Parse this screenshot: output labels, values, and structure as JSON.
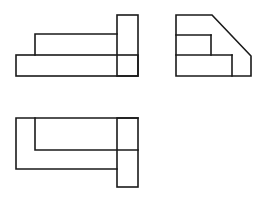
{
  "diagram": {
    "type": "orthographic-projection",
    "line_color": "#1a1a1a",
    "background": "#ffffff",
    "views": [
      {
        "name": "front-view",
        "position": "top-left",
        "outline": "stepped block: low wide base, raised middle step, tall right post"
      },
      {
        "name": "side-view",
        "position": "top-right",
        "outline": "profile with chamfered (diagonal) top-right edge and internal horizontal divisions"
      },
      {
        "name": "top-view",
        "position": "bottom-left",
        "outline": "L-shaped plan with a protruding right tab"
      }
    ]
  }
}
